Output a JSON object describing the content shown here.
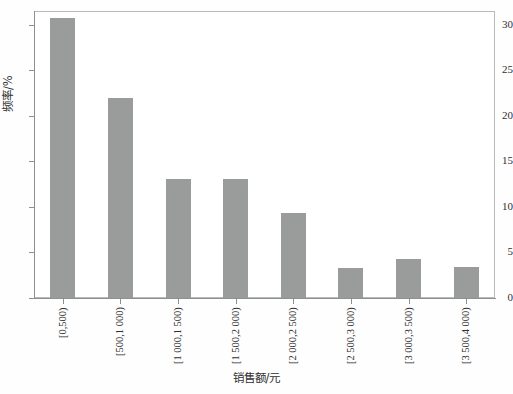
{
  "chart_data": {
    "type": "bar",
    "title": "",
    "subtitle": "",
    "xlabel": "销售额/元",
    "ylabel": "频率/%",
    "categories": [
      "[0,500)",
      "[500,1 000)",
      "[1 000,1 500)",
      "[1 500,2 000)",
      "[2 000,2 500)",
      "[2 500,3 000)",
      "[3 000,3 500)",
      "[3 500,4 000)"
    ],
    "values": [
      30.7,
      22.0,
      13.1,
      13.1,
      9.3,
      3.3,
      4.3,
      3.4
    ],
    "ylim": [
      0,
      31.5
    ],
    "yticks": [
      0,
      5,
      10,
      15,
      20,
      25,
      30
    ],
    "ytick_labels": [
      "0",
      "5",
      "10",
      "15",
      "20",
      "25",
      "30"
    ],
    "grid": false,
    "legend": false,
    "legend_position": "none",
    "bar_color": "#9a9c9c",
    "axis_color": "#8e9090",
    "frame_color": "#b9bbbb",
    "background_color": "#ffffff"
  }
}
